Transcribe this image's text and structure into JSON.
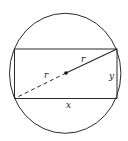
{
  "diagram": {
    "labels": {
      "radius_upper": "r",
      "radius_lower": "r",
      "width": "x",
      "height": "y"
    },
    "colors": {
      "stroke": "#2a2a2a",
      "background": "#ffffff"
    }
  }
}
